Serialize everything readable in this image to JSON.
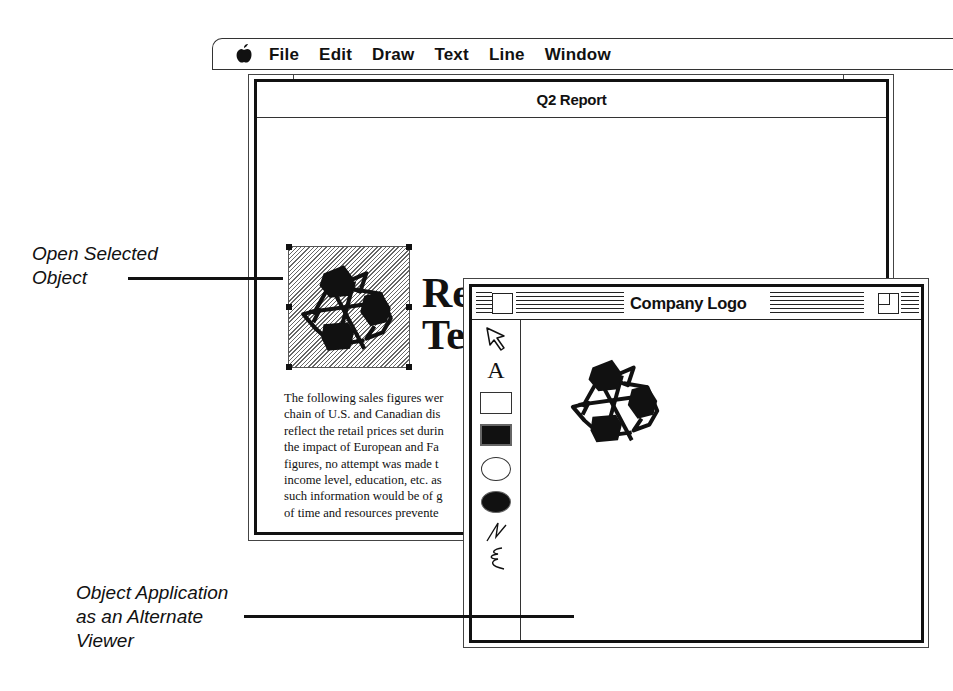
{
  "menubar": {
    "apple_icon": "apple-icon",
    "items": [
      {
        "label": "File"
      },
      {
        "label": "Edit"
      },
      {
        "label": "Draw"
      },
      {
        "label": "Text"
      },
      {
        "label": "Line"
      },
      {
        "label": "Window"
      }
    ]
  },
  "report_window": {
    "title": "Q2 Report",
    "embedded_object_icon": "recycle-icon",
    "heading_lines": [
      "Re",
      "Te"
    ],
    "body_lines": [
      "The following sales figures wer",
      "chain of U.S. and Canadian dis",
      "reflect the retail prices set durin",
      "the impact of European and Fa",
      "figures, no attempt was made t",
      "income level, education, etc. as",
      "such information would be of g",
      "of time and resources prevente"
    ]
  },
  "logo_window": {
    "title": "Company Logo",
    "close_icon": "close-box-icon",
    "zoom_icon": "zoom-box-icon",
    "tools": [
      {
        "name": "arrow-tool",
        "icon": "arrow-pointer-icon"
      },
      {
        "name": "text-tool",
        "icon": "letter-a-icon",
        "glyph": "A"
      },
      {
        "name": "rectangle-tool",
        "icon": "rectangle-outline-icon"
      },
      {
        "name": "filled-rectangle-tool",
        "icon": "rectangle-filled-icon"
      },
      {
        "name": "oval-tool",
        "icon": "oval-outline-icon"
      },
      {
        "name": "filled-oval-tool",
        "icon": "oval-filled-icon"
      },
      {
        "name": "polyline-tool",
        "icon": "zigzag-line-icon"
      },
      {
        "name": "freehand-tool",
        "icon": "freehand-scribble-icon"
      }
    ],
    "canvas_content": "recycle-icon"
  },
  "callouts": {
    "open_selected_object": [
      "Open Selected",
      "Object"
    ],
    "alternate_viewer": [
      "Object Application",
      "as an Alternate",
      "Viewer"
    ]
  }
}
